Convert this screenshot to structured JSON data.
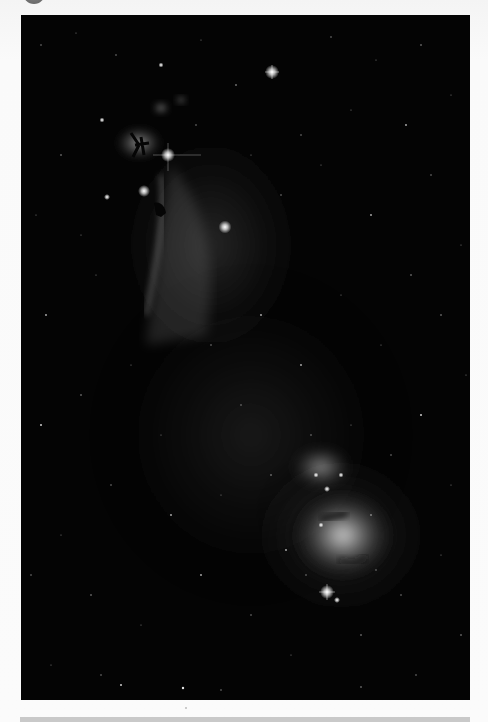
{
  "viewer": {
    "image_alt": "Astrophotograph of the Horsehead Nebula, Flame Nebula and Orion Nebula in grayscale",
    "image_type": "astrophotography",
    "color_mode": "grayscale"
  },
  "header": {
    "avatar_icon": "avatar-icon"
  },
  "colors": {
    "background": "#f7f7f7",
    "image_background": "#040404",
    "bottom_bar": "#c9c9c9",
    "avatar": "#6e6e6e"
  },
  "image": {
    "x": 21,
    "y": 15,
    "width": 449,
    "height": 685,
    "bright_stars": [
      {
        "x": 272,
        "y": 57,
        "r": 3.5
      },
      {
        "x": 148,
        "y": 140,
        "r": 3.5
      },
      {
        "x": 124,
        "y": 176,
        "r": 3
      },
      {
        "x": 205,
        "y": 212,
        "r": 3.5
      },
      {
        "x": 306,
        "y": 576,
        "r": 3.5
      },
      {
        "x": 140,
        "y": 50,
        "r": 1.5
      },
      {
        "x": 81,
        "y": 105,
        "r": 1.5
      },
      {
        "x": 86,
        "y": 182,
        "r": 1.5
      }
    ],
    "nebulae": [
      {
        "name": "Flame Nebula",
        "cx": 118,
        "cy": 128,
        "rx": 25,
        "ry": 18
      },
      {
        "name": "Horsehead Nebula region",
        "cx": 155,
        "cy": 230,
        "rx": 40,
        "ry": 90
      },
      {
        "name": "NGC 1977 (Running Man)",
        "cx": 300,
        "cy": 452,
        "rx": 30,
        "ry": 20
      },
      {
        "name": "Orion Nebula (M42)",
        "cx": 320,
        "cy": 525,
        "rx": 50,
        "ry": 45
      }
    ]
  }
}
